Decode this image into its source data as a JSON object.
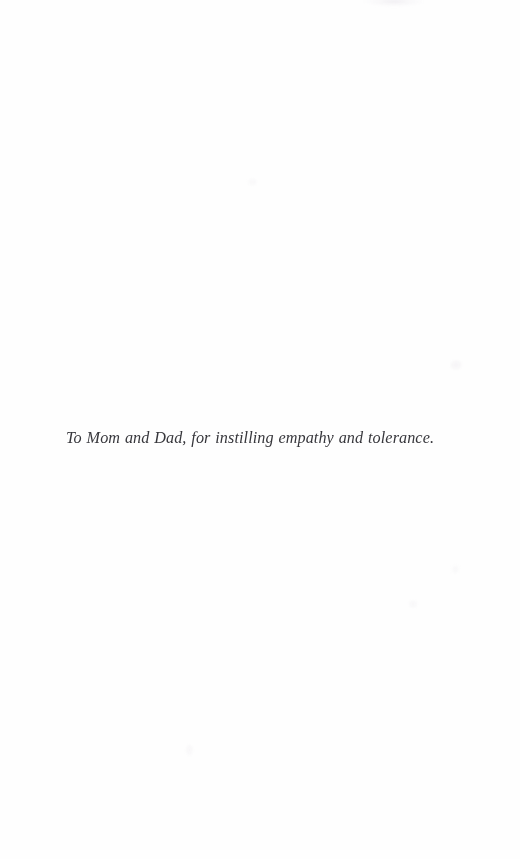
{
  "page": {
    "kind": "book-dedication-page",
    "background_color": "#fefefe",
    "width": 520,
    "height": 859
  },
  "dedication": {
    "text": "To Mom and Dad, for instilling empathy and tolerance.",
    "ink_color": "#2b2b30",
    "style": "italic-serif",
    "alignment": "centered"
  },
  "artifacts": {
    "description": "faint scanner smudges on blank paper"
  }
}
